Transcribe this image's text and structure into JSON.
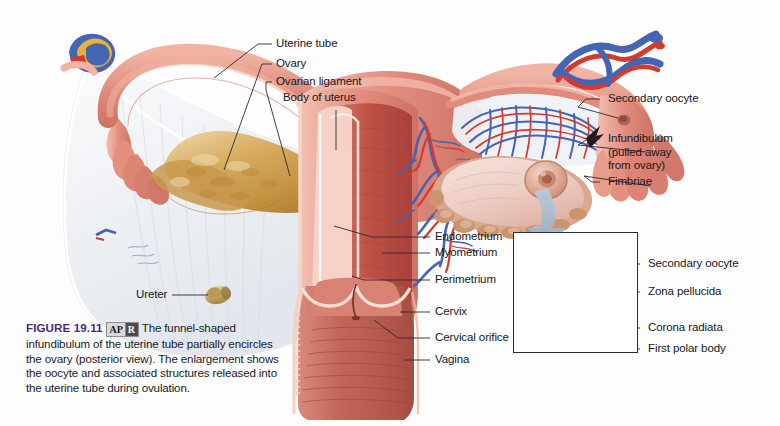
{
  "figure": {
    "number_label": "FIGURE 19.11",
    "badge": {
      "left": "AP",
      "right": "R"
    },
    "caption_text": "The funnel-shaped infundibulum of the uterine tube partially encircles the ovary (posterior view). The enlargement shows the oocyte and associated structures released into the uterine tube during ovulation."
  },
  "labels": {
    "uterine_tube": "Uterine tube",
    "ovary": "Ovary",
    "ovarian_ligament": "Ovarian ligament",
    "body_of_uterus": "Body of uterus",
    "ureter": "Ureter",
    "endometrium": "Endometrium",
    "myometrium": "Myometrium",
    "perimetrium": "Perimetrium",
    "cervix": "Cervix",
    "cervical_orifice": "Cervical orifice",
    "vagina": "Vagina",
    "secondary_oocyte_main": "Secondary oocyte",
    "infundibulum": "Infundibulum\n(pulled away\nfrom ovary)",
    "fimbriae": "Fimbriae",
    "secondary_oocyte_inset": "Secondary oocyte",
    "zona_pellucida": "Zona pellucida",
    "corona_radiata": "Corona radiata",
    "first_polar_body": "First polar body"
  },
  "colors": {
    "tissue_pink": "#e0877a",
    "tissue_pink_light": "#eda898",
    "myometrium": "#c2584c",
    "endometrium_pale": "#f3cfc4",
    "ovary_tan": "#c9984f",
    "ovary_tan_light": "#e3c389",
    "ligament_pale": "#e9ecef",
    "artery_red": "#d23b2e",
    "vein_blue": "#4464b4",
    "arrow_blue": "#9db4cc",
    "oocyte_gold": "#c89a44",
    "corona_salmon": "#ef9f8c",
    "label_text": "#17181a",
    "figure_purple": "#4b2a7b",
    "leader_line": "#2a2a30"
  }
}
